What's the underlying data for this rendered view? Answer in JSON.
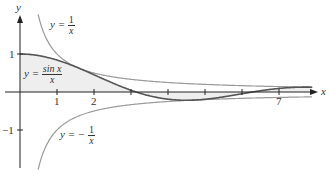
{
  "chart_data": {
    "type": "line",
    "title": "",
    "xlabel": "x",
    "ylabel": "y",
    "x_ticks": [
      1,
      2,
      3,
      4,
      5,
      6,
      7
    ],
    "x_tick_labels": [
      "1",
      "2",
      "",
      "",
      "",
      "",
      "7"
    ],
    "y_ticks": [
      1,
      -1
    ],
    "y_tick_labels": [
      "1",
      "−1"
    ],
    "xlim": [
      0,
      8.2
    ],
    "ylim": [
      -1.6,
      2.4
    ],
    "grid": false,
    "series": [
      {
        "name": "y = sin x / x",
        "function": "sin(x)/x",
        "color": "#555555",
        "fill_to_axis": true
      },
      {
        "name": "y = 1/x",
        "function": "1/x",
        "color": "#999999"
      },
      {
        "name": "y = -1/x",
        "function": "-1/x",
        "color": "#999999"
      }
    ],
    "annotations": [
      {
        "text": "y = 1/x",
        "near": "upper curve"
      },
      {
        "text": "y = sin x / x",
        "near": "shaded region"
      },
      {
        "text": "y = −1/x",
        "near": "lower curve"
      }
    ]
  },
  "labels": {
    "y_axis": "y",
    "x_axis": "x",
    "tick_1": "1",
    "tick_2": "2",
    "tick_7": "7",
    "ytick_1": "1",
    "ytick_neg1": "−1",
    "upper_eq_lhs": "y =",
    "upper_num": "1",
    "upper_den": "x",
    "sinc_eq_lhs": "y =",
    "sinc_num": "sin x",
    "sinc_den": "x",
    "lower_eq_lhs": "y = −",
    "lower_num": "1",
    "lower_den": "x"
  },
  "colors": {
    "axis": "#222222",
    "sinc": "#555555",
    "bounds": "#9a9a9a",
    "fill": "#eeeeee"
  }
}
